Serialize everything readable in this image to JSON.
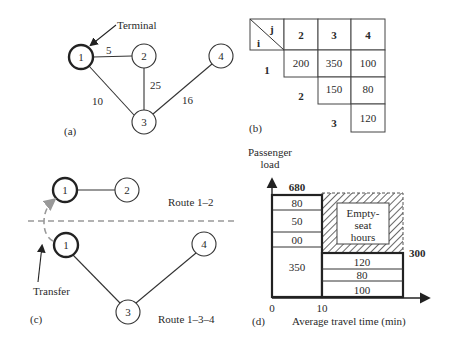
{
  "panel_a": {
    "label": "(a)",
    "terminal_label": "Terminal",
    "nodes": [
      {
        "id": "1",
        "terminal": true
      },
      {
        "id": "2",
        "terminal": false
      },
      {
        "id": "3",
        "terminal": false
      },
      {
        "id": "4",
        "terminal": false
      }
    ],
    "edges": [
      {
        "from": "1",
        "to": "2",
        "weight": "5"
      },
      {
        "from": "1",
        "to": "3",
        "weight": "10"
      },
      {
        "from": "2",
        "to": "3",
        "weight": "25"
      },
      {
        "from": "3",
        "to": "4",
        "weight": "16"
      }
    ]
  },
  "panel_b": {
    "label": "(b)",
    "corner_i": "i",
    "corner_j": "j",
    "col_headers": [
      "2",
      "3",
      "4"
    ],
    "row_headers": [
      "1",
      "2",
      "3"
    ],
    "rows": [
      [
        "200",
        "350",
        "100"
      ],
      [
        "",
        "150",
        "80"
      ],
      [
        "",
        "",
        "120"
      ]
    ]
  },
  "panel_c": {
    "label": "(c)",
    "route_top_label": "Route 1–2",
    "route_bottom_label": "Route 1–3–4",
    "transfer_label": "Transfer",
    "route_top_nodes": [
      "1",
      "2"
    ],
    "route_bottom_nodes": [
      "1",
      "3",
      "4"
    ]
  },
  "panel_d": {
    "label": "(d)",
    "ylabel_line1": "Passenger",
    "ylabel_line2": "load",
    "xlabel": "Average travel time (min)",
    "x_ticks": [
      "0",
      "10"
    ],
    "left_total": "680",
    "right_total": "300",
    "left_segments": [
      "80",
      "50",
      "00",
      "350"
    ],
    "right_segments": [
      "120",
      "80",
      "100"
    ],
    "empty_label_1": "Empty-",
    "empty_label_2": "seat",
    "empty_label_3": "hours"
  }
}
